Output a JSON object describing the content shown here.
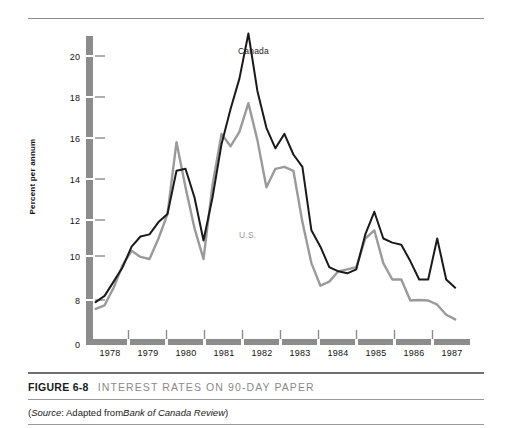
{
  "figure": {
    "number": "FIGURE 6-8",
    "title": "INTEREST RATES ON 90-DAY PAPER",
    "source_prefix": "(",
    "source_label": "Source",
    "source_mid": ": Adapted from ",
    "source_publication": "Bank of Canada Review",
    "source_suffix": ")"
  },
  "colors": {
    "canada_line": "#1a1a1a",
    "us_line": "#9a9a9a",
    "axis_bar": "#8c8c8c",
    "tick": "#8c8c8c",
    "rule": "#8b8b8b",
    "title_gray": "#8a8a8a",
    "background": "#ffffff"
  },
  "chart_data": {
    "type": "line",
    "title": "INTEREST RATES ON 90-DAY PAPER",
    "xlabel": "",
    "ylabel": "Percent per annum",
    "ylim": [
      0,
      21.5
    ],
    "y_axis_break": true,
    "y_break_between": [
      0,
      8
    ],
    "yticks": [
      0,
      8,
      10,
      12,
      14,
      16,
      18,
      20
    ],
    "ytick_labels": [
      "0",
      "8",
      "10",
      "12",
      "14",
      "16",
      "18",
      "20"
    ],
    "xlim": [
      1977.5,
      1987.9
    ],
    "xticks": [
      1978,
      1979,
      1980,
      1981,
      1982,
      1983,
      1984,
      1985,
      1986,
      1987
    ],
    "xtick_labels": [
      "1978",
      "1979",
      "1980",
      "1981",
      "1982",
      "1983",
      "1984",
      "1985",
      "1986",
      "1987"
    ],
    "grid": false,
    "legend": "inline-annotations",
    "annotations": [
      {
        "text": "Canada",
        "x": 1981.3,
        "y": 20.3,
        "color": "#1a1a1a"
      },
      {
        "text": "U.S.",
        "x": 1981.5,
        "y": 11.6,
        "color": "#9a9a9a"
      }
    ],
    "x": [
      1977.6,
      1977.85,
      1978.1,
      1978.35,
      1978.6,
      1978.85,
      1979.1,
      1979.35,
      1979.6,
      1979.85,
      1980.1,
      1980.35,
      1980.6,
      1980.85,
      1981.1,
      1981.35,
      1981.6,
      1981.85,
      1982.1,
      1982.35,
      1982.6,
      1982.85,
      1983.1,
      1983.35,
      1983.6,
      1983.85,
      1984.1,
      1984.35,
      1984.6,
      1984.85,
      1985.1,
      1985.35,
      1985.6,
      1985.85,
      1986.1,
      1986.35,
      1986.6,
      1986.85,
      1987.1,
      1987.35,
      1987.6
    ],
    "series": [
      {
        "name": "Canada",
        "color": "#1a1a1a",
        "values": [
          7.6,
          8.2,
          8.9,
          9.6,
          10.6,
          11.1,
          11.2,
          11.8,
          12.2,
          14.3,
          14.4,
          13.0,
          10.9,
          13.0,
          15.6,
          17.3,
          18.8,
          21.0,
          18.2,
          16.4,
          15.4,
          16.1,
          15.1,
          14.5,
          11.4,
          10.6,
          9.6,
          9.4,
          9.3,
          9.5,
          11.2,
          12.3,
          11.0,
          10.8,
          10.7,
          9.9,
          9.0,
          9.0,
          11.0,
          9.0,
          8.6
        ]
      },
      {
        "name": "U.S.",
        "color": "#9a9a9a",
        "values": [
          6.3,
          7.0,
          8.6,
          9.7,
          10.4,
          10.1,
          10.0,
          11.0,
          12.2,
          15.7,
          13.5,
          11.5,
          10.0,
          13.6,
          16.1,
          15.5,
          16.2,
          17.6,
          15.8,
          13.5,
          14.4,
          14.5,
          14.3,
          11.8,
          9.8,
          8.7,
          8.9,
          9.4,
          9.5,
          9.6,
          11.0,
          11.4,
          9.8,
          9.0,
          9.0,
          7.9,
          8.0,
          7.9,
          7.1,
          5.2,
          4.3
        ]
      }
    ],
    "canada_late_values_note": "Canada falls to ~6.5 in late 1986 then rises to ~9.2 in 1987 before ending ~8.6",
    "us_late_values_note": "U.S. declines below 6 through 1986, flattening near 5 then rising to ~7 by 1987"
  }
}
